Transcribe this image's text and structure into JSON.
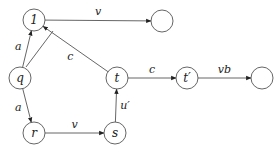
{
  "diagram": {
    "type": "directed-graph",
    "nodes": [
      {
        "id": "n1",
        "label": "1",
        "x": 34,
        "y": 20
      },
      {
        "id": "top_end",
        "label": "",
        "x": 162,
        "y": 21
      },
      {
        "id": "q",
        "label": "q",
        "x": 20,
        "y": 78
      },
      {
        "id": "t",
        "label": "t",
        "x": 117,
        "y": 78
      },
      {
        "id": "tp",
        "label": "t′",
        "x": 187,
        "y": 78
      },
      {
        "id": "right_end",
        "label": "",
        "x": 262,
        "y": 78
      },
      {
        "id": "r",
        "label": "r",
        "x": 34,
        "y": 133
      },
      {
        "id": "s",
        "label": "s",
        "x": 115,
        "y": 133
      }
    ],
    "edges": [
      {
        "from": "q",
        "to": "n1",
        "label": "a"
      },
      {
        "from": "q",
        "to": "r",
        "label": "a"
      },
      {
        "from": "r",
        "to": "s",
        "label": "v"
      },
      {
        "from": "s",
        "to": "t",
        "label": "u′"
      },
      {
        "from": "t",
        "to": "n1",
        "label": "c"
      },
      {
        "from": "n1",
        "to": "top_end",
        "label": "v"
      },
      {
        "from": "t",
        "to": "tp",
        "label": "c"
      },
      {
        "from": "tp",
        "to": "right_end",
        "label": "vb"
      }
    ]
  }
}
